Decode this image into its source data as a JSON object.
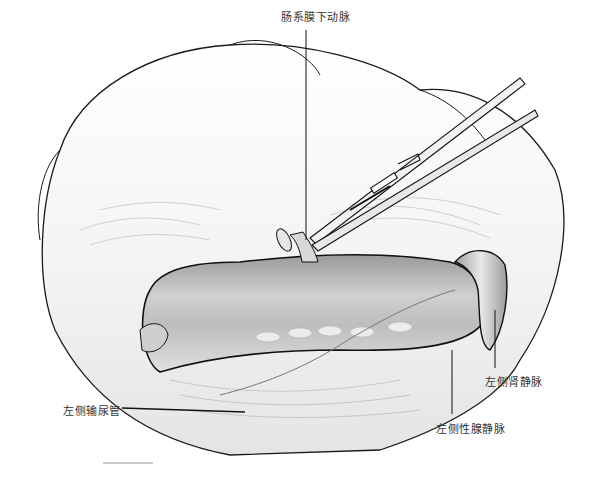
{
  "illustration": {
    "subject": "surgical exposure of left renal vein with forceps",
    "labels": {
      "inferior_mesenteric_artery": "肠系膜下动脉",
      "left_renal_vein": "左侧肾静脉",
      "left_gonadal_vein": "左侧性腺静脉",
      "left_ureter": "左侧输尿管"
    },
    "colors": {
      "outline": "#1a1a1a",
      "vessel_fill": "#b8b8b8",
      "vessel_highlight": "#e6e6e6",
      "tissue_fill": "#f7f7f7",
      "label_text": "#333333"
    }
  }
}
